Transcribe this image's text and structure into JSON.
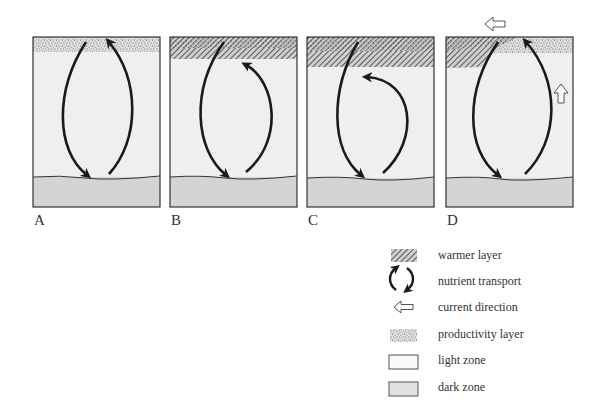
{
  "panels": [
    {
      "label": "A",
      "top_layer": "productivity layer",
      "arrows": "full loop top to bottom"
    },
    {
      "label": "B",
      "top_layer": "warmer layer (thin)",
      "arrows": "return arrow stops below warmer layer"
    },
    {
      "label": "C",
      "top_layer": "warmer layer (thick)",
      "arrows": "return arrow stops lower, below thicker warmer layer"
    },
    {
      "label": "D",
      "top_layer": "warmer layer pushed left, productivity layer right",
      "arrows": "full loop; current direction arrows left and up"
    }
  ],
  "legend": {
    "items": [
      {
        "icon": "hatch-icon",
        "label": "warmer layer"
      },
      {
        "icon": "nutrient-cycle-icon",
        "label": "nutrient transport"
      },
      {
        "icon": "hollow-arrow-left-icon",
        "label": "current direction"
      },
      {
        "icon": "stipple-icon",
        "label": "productivity layer"
      },
      {
        "icon": "light-box-icon",
        "label": "light zone"
      },
      {
        "icon": "dark-box-icon",
        "label": "dark zone"
      }
    ]
  },
  "colors": {
    "light_zone": "#efefef",
    "dark_zone": "#d4d4d4",
    "outline": "#333333",
    "arrow": "#1a1a1a"
  }
}
